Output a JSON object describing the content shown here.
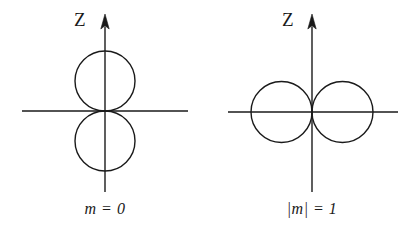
{
  "figure": {
    "background_color": "#ffffff",
    "stroke_color": "#1a1a1a",
    "panels": [
      {
        "id": "left",
        "axis_label": "Z",
        "caption": "m = 0",
        "orientation": "vertical-lobes",
        "lobe_count": 2,
        "origin": {
          "x": 105,
          "y": 111
        },
        "lobe_diameter": 60,
        "vertical_axis": {
          "x": 105,
          "top_y": 14,
          "bottom_y": 192,
          "arrow": "up"
        },
        "horizontal_axis": {
          "y": 111,
          "left_x": 22,
          "right_x": 188,
          "arrow": "none"
        },
        "lobes": [
          {
            "name": "upper-lobe",
            "cx": 105,
            "cy": 81,
            "r": 30
          },
          {
            "name": "lower-lobe",
            "cx": 105,
            "cy": 141,
            "r": 30
          }
        ]
      },
      {
        "id": "right",
        "axis_label": "Z",
        "caption": "|m| = 1",
        "orientation": "horizontal-lobes",
        "lobe_count": 2,
        "origin": {
          "x": 312,
          "y": 112
        },
        "lobe_diameter": 61,
        "vertical_axis": {
          "x": 312,
          "top_y": 14,
          "bottom_y": 192,
          "arrow": "up"
        },
        "horizontal_axis": {
          "y": 112,
          "left_x": 228,
          "right_x": 398,
          "arrow": "none"
        },
        "lobes": [
          {
            "name": "left-lobe",
            "cx": 281.5,
            "cy": 112,
            "r": 30.5
          },
          {
            "name": "right-lobe",
            "cx": 342.5,
            "cy": 112,
            "r": 30.5
          }
        ]
      }
    ]
  }
}
